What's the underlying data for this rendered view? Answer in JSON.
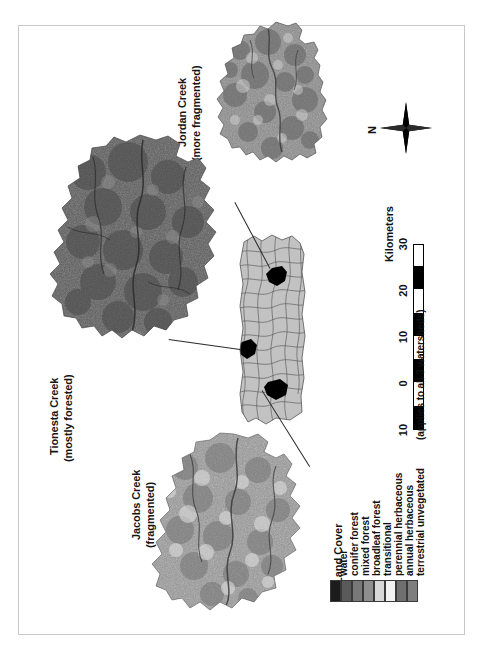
{
  "figure": {
    "frame_color": "#c9c9c9"
  },
  "watersheds": [
    {
      "id": "jordan-creek",
      "name": "Jordan Creek",
      "descriptor": "(more fragmented)",
      "label_line1": "Jordan Creek",
      "label_line2": "(more fragmented)"
    },
    {
      "id": "tionesta-creek",
      "name": "Tionesta Creek",
      "descriptor": "(mostly forested)",
      "label_line1": "Tionesta Creek",
      "label_line2": "(mostly forested)"
    },
    {
      "id": "jacobs-creek",
      "name": "Jacobs Creek",
      "descriptor": "(fragmented)",
      "label_line1": "Jacobs Creek",
      "label_line2": "(fragmented)"
    }
  ],
  "north_arrow": {
    "label": "N",
    "icon": "compass-north-arrow-icon"
  },
  "scalebar": {
    "units": "Kilometers",
    "note": "(applies to all 3 watersheds)",
    "ticks": [
      "10",
      "0",
      "10",
      "20",
      "30"
    ],
    "tick_values": [
      -10,
      0,
      10,
      20,
      30
    ],
    "segment_count": 5
  },
  "legend": {
    "title": "Land Cover",
    "items": [
      {
        "label": "water",
        "color": "#1c1c1c"
      },
      {
        "label": "conifer forest",
        "color": "#5a5a5a"
      },
      {
        "label": "mixed forest",
        "color": "#787878"
      },
      {
        "label": "broadleaf forest",
        "color": "#8e8e8e"
      },
      {
        "label": "transitional",
        "color": "#d8d8d8"
      },
      {
        "label": "perennial herbaceous",
        "color": "#f2f2f2"
      },
      {
        "label": "annual herbaceous",
        "color": "#6f6f6f"
      },
      {
        "label": "terrestrial unvegetated",
        "color": "#7e7e7e"
      }
    ]
  },
  "inset": {
    "name": "pennsylvania-state-outline",
    "fill": "#c2c2c2",
    "boundary_color": "#4a4a4a",
    "highlight_color": "#000000",
    "highlight_count": 3
  }
}
